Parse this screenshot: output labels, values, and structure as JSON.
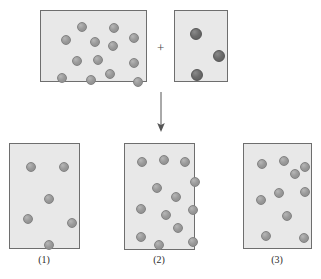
{
  "figure": {
    "width": 321,
    "height": 279,
    "background_color": "#ffffff",
    "colors": {
      "box_fill": "#e8e8e8",
      "box_border": "#6e6e6e",
      "light_particle": "#9a9a9a",
      "dark_particle": "#6b6b6b",
      "arrow": "#555555",
      "label_text": "#2b2b2b"
    }
  },
  "operator": {
    "plus_symbol": "+",
    "x": 157,
    "y": 41
  },
  "arrow": {
    "symbol": "down-arrow",
    "x": 161,
    "y_start": 92,
    "y_end": 132
  },
  "reactant_boxes": [
    {
      "id": "reactant-a",
      "name": "reactant-box-a",
      "x": 40,
      "y": 10,
      "width": 107,
      "height": 72,
      "particle_type": "light",
      "particle_count": 13,
      "particle_radius": 5,
      "particles": [
        {
          "cx": 20,
          "cy": 24
        },
        {
          "cx": 36,
          "cy": 11
        },
        {
          "cx": 31,
          "cy": 45
        },
        {
          "cx": 16,
          "cy": 62
        },
        {
          "cx": 52,
          "cy": 44
        },
        {
          "cx": 45,
          "cy": 64
        },
        {
          "cx": 67,
          "cy": 30
        },
        {
          "cx": 68,
          "cy": 12
        },
        {
          "cx": 64,
          "cy": 58
        },
        {
          "cx": 88,
          "cy": 22
        },
        {
          "cx": 88,
          "cy": 47
        },
        {
          "cx": 92,
          "cy": 66
        },
        {
          "cx": 49,
          "cy": 26
        }
      ]
    },
    {
      "id": "reactant-b",
      "name": "reactant-box-b",
      "x": 174,
      "y": 10,
      "width": 54,
      "height": 72,
      "particle_type": "dark",
      "particle_count": 3,
      "particle_radius": 6,
      "particles": [
        {
          "cx": 15,
          "cy": 17
        },
        {
          "cx": 38,
          "cy": 39
        },
        {
          "cx": 16,
          "cy": 58
        }
      ]
    }
  ],
  "product_boxes": [
    {
      "id": "product-1",
      "name": "product-box-1",
      "label": "(1)",
      "x": 9,
      "y": 143,
      "width": 71,
      "height": 106,
      "label_x": 44,
      "label_y": 254,
      "particle_type": "light",
      "particle_count": 6,
      "particle_radius": 5,
      "particles": [
        {
          "cx": 16,
          "cy": 18
        },
        {
          "cx": 49,
          "cy": 18
        },
        {
          "cx": 34,
          "cy": 50
        },
        {
          "cx": 13,
          "cy": 70
        },
        {
          "cx": 57,
          "cy": 74
        },
        {
          "cx": 34,
          "cy": 96
        }
      ]
    },
    {
      "id": "product-2",
      "name": "product-box-2",
      "label": "(2)",
      "x": 124,
      "y": 143,
      "width": 71,
      "height": 107,
      "label_x": 159,
      "label_y": 254,
      "particle_type": "light",
      "particle_count": 13,
      "particle_radius": 5,
      "particles": [
        {
          "cx": 12,
          "cy": 13
        },
        {
          "cx": 34,
          "cy": 11
        },
        {
          "cx": 55,
          "cy": 13
        },
        {
          "cx": 65,
          "cy": 33
        },
        {
          "cx": 27,
          "cy": 39
        },
        {
          "cx": 46,
          "cy": 48
        },
        {
          "cx": 11,
          "cy": 60
        },
        {
          "cx": 63,
          "cy": 61
        },
        {
          "cx": 48,
          "cy": 79
        },
        {
          "cx": 11,
          "cy": 88
        },
        {
          "cx": 29,
          "cy": 96
        },
        {
          "cx": 63,
          "cy": 93
        },
        {
          "cx": 36,
          "cy": 66
        }
      ]
    },
    {
      "id": "product-3",
      "name": "product-box-3",
      "label": "(3)",
      "x": 243,
      "y": 143,
      "width": 69,
      "height": 106,
      "label_x": 277,
      "label_y": 254,
      "particle_type": "light",
      "particle_count": 10,
      "particle_radius": 5,
      "particles": [
        {
          "cx": 13,
          "cy": 15
        },
        {
          "cx": 35,
          "cy": 12
        },
        {
          "cx": 56,
          "cy": 18
        },
        {
          "cx": 30,
          "cy": 44
        },
        {
          "cx": 12,
          "cy": 51
        },
        {
          "cx": 56,
          "cy": 43
        },
        {
          "cx": 38,
          "cy": 67
        },
        {
          "cx": 17,
          "cy": 87
        },
        {
          "cx": 55,
          "cy": 89
        },
        {
          "cx": 46,
          "cy": 25
        }
      ]
    }
  ]
}
